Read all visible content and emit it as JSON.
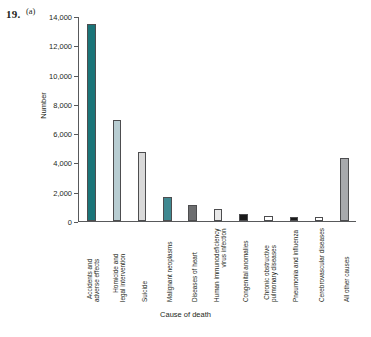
{
  "figure": {
    "number": "19.",
    "part": "(a)"
  },
  "chart_data": {
    "type": "bar",
    "title": "",
    "xlabel": "Cause of death",
    "ylabel": "Number",
    "ylim": [
      0,
      14000
    ],
    "ytick_labels": [
      "0",
      "2,000",
      "4,000",
      "6,000",
      "8,000",
      "10,000",
      "12,000",
      "14,000"
    ],
    "ytick_values": [
      0,
      2000,
      4000,
      6000,
      8000,
      10000,
      12000,
      14000
    ],
    "grid": false,
    "legend": "none",
    "categories": [
      "Accidents and adverse effects",
      "Homicide and legal intervention",
      "Suicide",
      "Malignant neoplasms",
      "Diseases of heart",
      "Human immunodeficiency virus infection",
      "Congenital anomalies",
      "Chronic obstructive pulmonary diseases",
      "Pneumonia and influenza",
      "Cerebrovascular diseases",
      "All other causes"
    ],
    "category_lines": [
      [
        "Accidents and",
        "adverse effects"
      ],
      [
        "Homicide and",
        "legal intervention"
      ],
      [
        "Suicide"
      ],
      [
        "Malignant neoplasms"
      ],
      [
        "Diseases of heart"
      ],
      [
        "Human immunodeficiency",
        "virus infection"
      ],
      [
        "Congenital anomalies"
      ],
      [
        "Chronic obstructive",
        "pulmonary diseases"
      ],
      [
        "Pneumonia and influenza"
      ],
      [
        "Cerebrovascular diseases"
      ],
      [
        "All other causes"
      ]
    ],
    "values": [
      13500,
      6900,
      4750,
      1650,
      1100,
      800,
      450,
      350,
      300,
      300,
      4300
    ],
    "bar_colors": [
      "#1a7478",
      "#b8cdd2",
      "#d9d9d9",
      "#3f8890",
      "#6d6e70",
      "#e8e8e8",
      "#1a1a1a",
      "#ffffff",
      "#1a1a1a",
      "#ffffff",
      "#a7a9ac"
    ],
    "bar_edge_color": "#4d4d4f"
  }
}
